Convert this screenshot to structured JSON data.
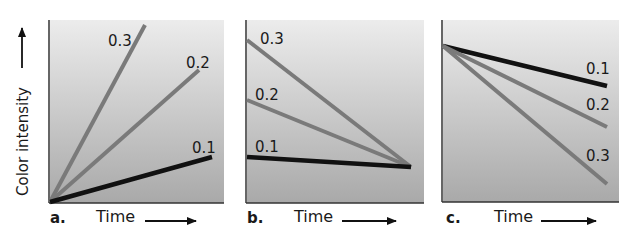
{
  "y_axis_label": "Color intensity",
  "colors": {
    "background_top": "#ececec",
    "background_bottom": "#a8a8a8",
    "gray_line": "#7a7a7a",
    "black_line": "#111111",
    "axis": "#333333"
  },
  "panels": [
    {
      "id": "a",
      "label": "a.",
      "xlabel": "Time",
      "series": [
        {
          "name": "0.3",
          "x1": 50,
          "y1": 202,
          "x2": 145,
          "y2": 25,
          "color": "gray",
          "lx": 108,
          "ly": 46
        },
        {
          "name": "0.2",
          "x1": 50,
          "y1": 202,
          "x2": 199,
          "y2": 70,
          "color": "gray",
          "lx": 186,
          "ly": 68
        },
        {
          "name": "0.1",
          "x1": 50,
          "y1": 202,
          "x2": 212,
          "y2": 157,
          "color": "black",
          "lx": 192,
          "ly": 153
        }
      ]
    },
    {
      "id": "b",
      "label": "b.",
      "xlabel": "Time",
      "series": [
        {
          "name": "0.3",
          "x1": 247,
          "y1": 40,
          "x2": 411,
          "y2": 167,
          "color": "gray",
          "lx": 260,
          "ly": 44
        },
        {
          "name": "0.2",
          "x1": 247,
          "y1": 100,
          "x2": 411,
          "y2": 167,
          "color": "gray",
          "lx": 255,
          "ly": 100
        },
        {
          "name": "0.1",
          "x1": 247,
          "y1": 157,
          "x2": 411,
          "y2": 167,
          "color": "black",
          "lx": 255,
          "ly": 152
        }
      ]
    },
    {
      "id": "c",
      "label": "c.",
      "xlabel": "Time",
      "series": [
        {
          "name": "0.1",
          "x1": 443,
          "y1": 46,
          "x2": 607,
          "y2": 86,
          "color": "black",
          "lx": 586,
          "ly": 74
        },
        {
          "name": "0.2",
          "x1": 443,
          "y1": 46,
          "x2": 607,
          "y2": 127,
          "color": "gray",
          "lx": 586,
          "ly": 110
        },
        {
          "name": "0.3",
          "x1": 443,
          "y1": 46,
          "x2": 607,
          "y2": 184,
          "color": "gray",
          "lx": 586,
          "ly": 161
        }
      ]
    }
  ],
  "chart_data": [
    {
      "type": "line",
      "title": "a.",
      "xlabel": "Time",
      "ylabel": "Color intensity",
      "grid": false,
      "series": [
        {
          "name": "0.3",
          "x": [
            0,
            1
          ],
          "y": [
            0,
            1.0
          ]
        },
        {
          "name": "0.2",
          "x": [
            0,
            1
          ],
          "y": [
            0,
            0.74
          ]
        },
        {
          "name": "0.1",
          "x": [
            0,
            1
          ],
          "y": [
            0,
            0.25
          ]
        }
      ]
    },
    {
      "type": "line",
      "title": "b.",
      "xlabel": "Time",
      "ylabel": "Color intensity",
      "grid": false,
      "series": [
        {
          "name": "0.3",
          "x": [
            0,
            1
          ],
          "y": [
            0.89,
            0.2
          ]
        },
        {
          "name": "0.2",
          "x": [
            0,
            1
          ],
          "y": [
            0.56,
            0.2
          ]
        },
        {
          "name": "0.1",
          "x": [
            0,
            1
          ],
          "y": [
            0.25,
            0.2
          ]
        }
      ]
    },
    {
      "type": "line",
      "title": "c.",
      "xlabel": "Time",
      "ylabel": "Color intensity",
      "grid": false,
      "series": [
        {
          "name": "0.1",
          "x": [
            0,
            1
          ],
          "y": [
            0.86,
            0.64
          ]
        },
        {
          "name": "0.2",
          "x": [
            0,
            1
          ],
          "y": [
            0.86,
            0.42
          ]
        },
        {
          "name": "0.3",
          "x": [
            0,
            1
          ],
          "y": [
            0.86,
            0.1
          ]
        }
      ]
    }
  ]
}
